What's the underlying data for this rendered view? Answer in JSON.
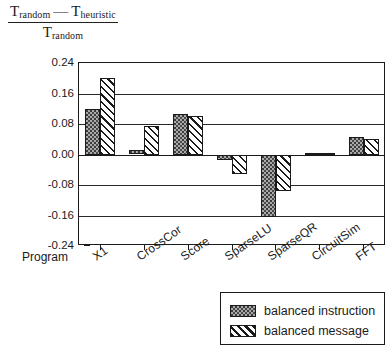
{
  "chart_data": {
    "type": "bar",
    "title": "",
    "xlabel": "Program",
    "ylabel_numerator_left": "T",
    "ylabel_numerator_left_sub": "random",
    "ylabel_minus": "—",
    "ylabel_numerator_right": "T",
    "ylabel_numerator_right_sub": "heuristic",
    "ylabel_denominator": "T",
    "ylabel_denominator_sub": "random",
    "categories": [
      "X1",
      "CrossCor",
      "Score",
      "SparseLU",
      "SparseQR",
      "CircuitSim",
      "FFT"
    ],
    "series": [
      {
        "name": "balanced instruction",
        "pattern": "stipple-gray",
        "values": [
          0.12,
          0.012,
          0.105,
          -0.015,
          -0.165,
          0.005,
          0.045
        ]
      },
      {
        "name": "balanced message",
        "pattern": "diagonal-hatch",
        "values": [
          0.2,
          0.075,
          0.1,
          -0.05,
          -0.095,
          0.004,
          0.04
        ]
      }
    ],
    "yticks": [
      "0.24",
      "0.16",
      "0.08",
      "0.00",
      "-0.08",
      "-0.16",
      "-0.24"
    ],
    "ytick_values": [
      0.24,
      0.16,
      0.08,
      0.0,
      -0.08,
      -0.16,
      -0.24
    ],
    "ylim": [
      -0.24,
      0.24
    ],
    "grid": true,
    "legend_position": "bottom-right"
  },
  "legend": {
    "items": [
      {
        "label": "balanced instruction"
      },
      {
        "label": "balanced message"
      }
    ]
  },
  "colors": {
    "axis": "#1a1a1a",
    "instruction_fill": "#a9a9a9",
    "message_fill": "#ffffff",
    "background": "#ffffff"
  }
}
